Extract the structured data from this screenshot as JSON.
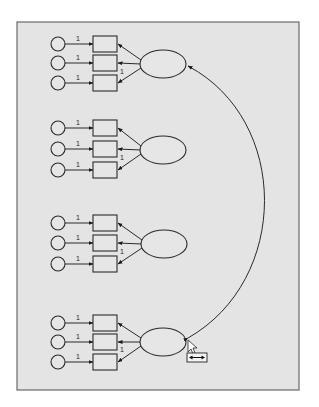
{
  "diagram": {
    "type": "structural-equation-model",
    "panel": {
      "x": 17,
      "y": 22,
      "width": 282,
      "height": 368,
      "fill": "#e4e4e4"
    },
    "path_label": "1",
    "groups": [
      {
        "id": "factor-1",
        "latent": {
          "cx": 163,
          "cy": 64
        },
        "indicators_y": [
          44,
          63,
          83
        ]
      },
      {
        "id": "factor-2",
        "latent": {
          "cx": 163,
          "cy": 150
        },
        "indicators_y": [
          128,
          149,
          170
        ]
      },
      {
        "id": "factor-3",
        "latent": {
          "cx": 164,
          "cy": 244
        },
        "indicators_y": [
          223,
          243,
          264
        ]
      },
      {
        "id": "factor-4",
        "latent": {
          "cx": 163,
          "cy": 342
        },
        "indicators_y": [
          323,
          342,
          362
        ]
      }
    ],
    "covariance": {
      "from": "factor-4",
      "to": "factor-1",
      "label": "double-headed curved arrow"
    },
    "cursor": {
      "tool": "draw-covariance-tool",
      "icon": "double-arrow-icon"
    }
  }
}
